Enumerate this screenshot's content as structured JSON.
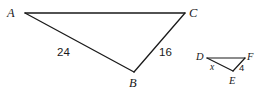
{
  "figure": {
    "name": "similar-triangles-diagram",
    "background_color": "#ffffff",
    "stroke_color": "#1a1a1a",
    "stroke_width": 1.3
  },
  "triangles": [
    {
      "name": "triangle-ABC",
      "vertices": [
        {
          "label": "A",
          "x": 25,
          "y": 13
        },
        {
          "label": "C",
          "x": 185,
          "y": 13
        },
        {
          "label": "B",
          "x": 134,
          "y": 72
        }
      ],
      "side_labels": [
        {
          "label": "24",
          "side": "AB"
        },
        {
          "label": "16",
          "side": "BC"
        }
      ]
    },
    {
      "name": "triangle-DEF",
      "vertices": [
        {
          "label": "D",
          "x": 207,
          "y": 58
        },
        {
          "label": "F",
          "x": 245,
          "y": 58
        },
        {
          "label": "E",
          "x": 233,
          "y": 71
        }
      ],
      "side_labels": [
        {
          "label": "x",
          "side": "DE"
        },
        {
          "label": "4",
          "side": "EF"
        }
      ]
    }
  ],
  "labels": {
    "A": "A",
    "B": "B",
    "C": "C",
    "D": "D",
    "E": "E",
    "F": "F",
    "len_AB": "24",
    "len_BC": "16",
    "len_DE": "x",
    "len_EF": "4"
  }
}
